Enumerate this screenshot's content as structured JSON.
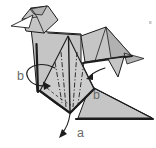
{
  "diagram": {
    "type": "origami-fold-step-illustration",
    "labels": {
      "point_a": "a",
      "point_b_left": "b",
      "point_b_right": "b"
    },
    "colors": {
      "paper": "#c5c5c5",
      "paper_dark": "#b1b1b1",
      "paper_light": "#cdcdcd",
      "ink": "#1c1c1c",
      "label": "#6a6a6a",
      "background": "#ffffff"
    }
  }
}
